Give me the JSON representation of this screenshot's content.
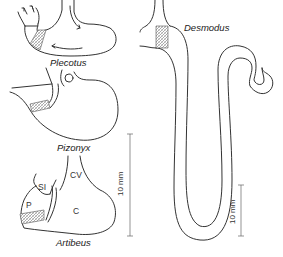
{
  "figure": {
    "specimens": [
      {
        "id": "plecotus",
        "label": "Plecotus"
      },
      {
        "id": "pizonyx",
        "label": "Pizonyx"
      },
      {
        "id": "artibeus",
        "label": "Artibeus"
      },
      {
        "id": "desmodus",
        "label": "Desmodus"
      }
    ],
    "artibeus_regions": {
      "si": "SI",
      "p": "P",
      "cv": "CV",
      "c": "C"
    },
    "scale_bars": [
      {
        "id": "scale-left",
        "label": "10 mm"
      },
      {
        "id": "scale-right",
        "label": "10 mm"
      }
    ],
    "colors": {
      "line": "#333333",
      "hatch": "#888888",
      "background": "#ffffff"
    }
  }
}
